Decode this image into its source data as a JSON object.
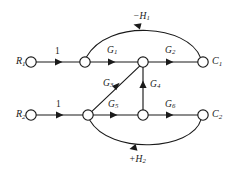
{
  "figure": {
    "type": "signal-flow-graph",
    "background_color": "#ffffff",
    "line_color": "#1a1a1a",
    "width": 235,
    "height": 176
  },
  "nodes": [
    {
      "id": "R1",
      "label": "R",
      "subscript": "1",
      "x": 31,
      "y": 62,
      "r": 5.2,
      "role": "input-source"
    },
    {
      "id": "n1",
      "label": "",
      "subscript": "",
      "x": 85,
      "y": 62,
      "r": 5.2,
      "role": "summing-junction"
    },
    {
      "id": "n2",
      "label": "",
      "subscript": "",
      "x": 143,
      "y": 62,
      "r": 5.2,
      "role": "junction"
    },
    {
      "id": "C1",
      "label": "C",
      "subscript": "1",
      "x": 203,
      "y": 62,
      "r": 5.2,
      "role": "output-sink"
    },
    {
      "id": "R2",
      "label": "R",
      "subscript": "2",
      "x": 31,
      "y": 115,
      "r": 5.2,
      "role": "input-source"
    },
    {
      "id": "n3",
      "label": "",
      "subscript": "",
      "x": 88,
      "y": 115,
      "r": 5.2,
      "role": "summing-junction"
    },
    {
      "id": "n4",
      "label": "",
      "subscript": "",
      "x": 143,
      "y": 115,
      "r": 5.2,
      "role": "junction"
    },
    {
      "id": "C2",
      "label": "C",
      "subscript": "2",
      "x": 203,
      "y": 115,
      "r": 5.2,
      "role": "output-sink"
    }
  ],
  "edges": [
    {
      "id": "e-r1-n1",
      "from": "R1",
      "to": "n1",
      "gain": "1",
      "gain_sub": "",
      "italic": false,
      "shape": "straight",
      "label_x": 55,
      "label_y": 47
    },
    {
      "id": "e-n1-n2",
      "from": "n1",
      "to": "n2",
      "gain": "G",
      "gain_sub": "1",
      "italic": true,
      "shape": "straight",
      "label_x": 107,
      "label_y": 46
    },
    {
      "id": "e-n2-c1",
      "from": "n2",
      "to": "C1",
      "gain": "G",
      "gain_sub": "2",
      "italic": true,
      "shape": "straight",
      "label_x": 165,
      "label_y": 46
    },
    {
      "id": "e-c1-n1",
      "from": "C1",
      "to": "n1",
      "gain": "−H",
      "gain_sub": "1",
      "italic": true,
      "shape": "arc-top",
      "label_x": 133,
      "label_y": 12
    },
    {
      "id": "e-r2-n3",
      "from": "R2",
      "to": "n3",
      "gain": "1",
      "gain_sub": "",
      "italic": false,
      "shape": "straight",
      "label_x": 56,
      "label_y": 100
    },
    {
      "id": "e-n3-n4",
      "from": "n3",
      "to": "n4",
      "gain": "G",
      "gain_sub": "5",
      "italic": true,
      "shape": "straight",
      "label_x": 108,
      "label_y": 100
    },
    {
      "id": "e-n4-c2",
      "from": "n4",
      "to": "C2",
      "gain": "G",
      "gain_sub": "6",
      "italic": true,
      "shape": "straight",
      "label_x": 165,
      "label_y": 100
    },
    {
      "id": "e-n3-n2",
      "from": "n3",
      "to": "n2",
      "gain": "G",
      "gain_sub": "3",
      "italic": true,
      "shape": "diagonal",
      "label_x": 103,
      "label_y": 79
    },
    {
      "id": "e-n4-n2",
      "from": "n4",
      "to": "n2",
      "gain": "G",
      "gain_sub": "4",
      "italic": true,
      "shape": "vertical",
      "label_x": 150,
      "label_y": 80
    },
    {
      "id": "e-c2-n3",
      "from": "C2",
      "to": "n3",
      "gain": "+H",
      "gain_sub": "2",
      "italic": true,
      "shape": "arc-bottom",
      "label_x": 129,
      "label_y": 155
    }
  ],
  "terminals": [
    {
      "id": "label-R1",
      "text": "R",
      "sub": "1",
      "x": 16,
      "y": 56
    },
    {
      "id": "label-C1",
      "text": "C",
      "sub": "1",
      "x": 212,
      "y": 56
    },
    {
      "id": "label-R2",
      "text": "R",
      "sub": "2",
      "x": 16,
      "y": 109
    },
    {
      "id": "label-C2",
      "text": "C",
      "sub": "2",
      "x": 212,
      "y": 109
    }
  ]
}
